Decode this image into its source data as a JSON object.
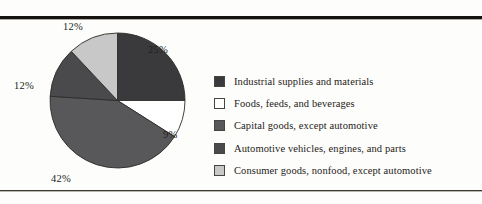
{
  "figure": {
    "background_color": "#fdfdfb",
    "rule_color": "#15130f"
  },
  "chart_data": {
    "type": "pie",
    "title": "",
    "categories": [
      "Industrial supplies and materials",
      "Foods, feeds, and beverages",
      "Capital goods, except automotive",
      "Automotive vehicles, engines, and parts",
      "Consumer goods, nonfood, except automotive"
    ],
    "values": [
      25,
      9,
      42,
      12,
      12
    ],
    "value_labels": [
      "25%",
      "9%",
      "42%",
      "12%",
      "12%"
    ],
    "colors": [
      "#3a3a3c",
      "#ffffff",
      "#58585a",
      "#4a4a4c",
      "#c8c8c8"
    ],
    "start_angle_deg": 0,
    "direction": "clockwise",
    "legend_position": "right",
    "grid": false,
    "xlabel": "",
    "ylabel": ""
  },
  "legend": {
    "items": [
      {
        "label": "Industrial supplies and materials",
        "color": "#3a3a3c"
      },
      {
        "label": "Foods, feeds, and beverages",
        "color": "#ffffff"
      },
      {
        "label": "Capital goods, except automotive",
        "color": "#58585a"
      },
      {
        "label": "Automotive vehicles, engines, and parts",
        "color": "#4a4a4c"
      },
      {
        "label": "Consumer goods, nonfood, except automotive",
        "color": "#c8c8c8"
      }
    ]
  }
}
